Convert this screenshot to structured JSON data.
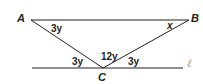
{
  "diagram": {
    "vertices": {
      "A": {
        "label": "A"
      },
      "B": {
        "label": "B"
      },
      "C": {
        "label": "C"
      }
    },
    "line_label": "ℓ",
    "angles": {
      "angle_A": "3y",
      "angle_B": "x",
      "angle_C_left": "3y",
      "angle_C_top": "12y",
      "angle_C_right": "3y"
    },
    "colors": {
      "stroke": "#231f20",
      "line_label": "#9a9a9a"
    }
  }
}
